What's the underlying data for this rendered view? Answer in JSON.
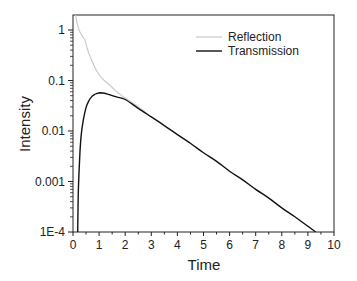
{
  "chart_data": {
    "type": "line",
    "title": "",
    "xlabel": "Time",
    "ylabel": "Intensity",
    "xlim": [
      0,
      10
    ],
    "ylim": [
      0.0001,
      2
    ],
    "yscale": "log",
    "x_ticks": [
      "0",
      "1",
      "2",
      "3",
      "4",
      "5",
      "6",
      "7",
      "8",
      "9",
      "10"
    ],
    "y_ticks": [
      "1E-4",
      "0.001",
      "0.01",
      "0.1",
      "1"
    ],
    "grid": false,
    "legend_position": "upper right",
    "series": [
      {
        "name": "Reflection",
        "color": "#c8c8c8",
        "x": [
          0.1,
          0.15,
          0.23,
          0.3,
          0.4,
          0.46,
          0.55,
          0.65,
          0.75,
          0.84,
          1.0,
          1.2,
          1.42,
          1.6,
          1.8,
          2.0,
          2.5,
          3.0
        ],
        "y": [
          2.0,
          1.4,
          1.0,
          0.85,
          0.7,
          0.63,
          0.42,
          0.3,
          0.23,
          0.18,
          0.13,
          0.1,
          0.08,
          0.065,
          0.053,
          0.045,
          0.03,
          0.019
        ]
      },
      {
        "name": "Transmission",
        "color": "#111111",
        "x": [
          0.18,
          0.2,
          0.23,
          0.27,
          0.32,
          0.4,
          0.5,
          0.6,
          0.7,
          0.8,
          0.9,
          1.05,
          1.2,
          1.42,
          1.7,
          2.0,
          2.5,
          3.0,
          3.5,
          4.0,
          4.5,
          5.0,
          5.5,
          6.0,
          6.5,
          7.0,
          7.5,
          8.0,
          8.5,
          9.0,
          9.3
        ],
        "y": [
          0.0001,
          0.0005,
          0.0015,
          0.004,
          0.009,
          0.017,
          0.029,
          0.039,
          0.047,
          0.052,
          0.055,
          0.057,
          0.056,
          0.052,
          0.047,
          0.042,
          0.028,
          0.019,
          0.0128,
          0.0085,
          0.0057,
          0.0037,
          0.0025,
          0.0016,
          0.00108,
          0.0007,
          0.00047,
          0.0003,
          0.0002,
          0.00013,
          0.0001
        ]
      }
    ]
  },
  "legend": {
    "items": [
      {
        "label": "Reflection",
        "color": "#c8c8c8"
      },
      {
        "label": "Transmission",
        "color": "#111111"
      }
    ]
  },
  "axes": {
    "xlabel": "Time",
    "ylabel": "Intensity"
  }
}
